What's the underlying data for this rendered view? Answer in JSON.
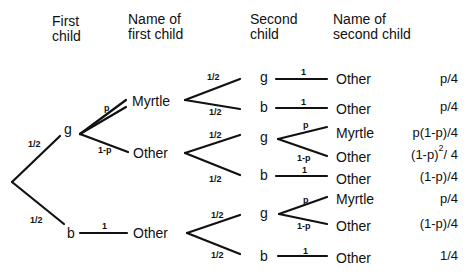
{
  "headers": {
    "first_child": "First\nchild",
    "first_child_l1": "First",
    "first_child_l2": "child",
    "name_first_l1": "Name of",
    "name_first_l2": "first  child",
    "second_child_l1": "Second",
    "second_child_l2": "child",
    "name_second_l1": "Name of",
    "name_second_l2": "second child"
  },
  "level1": {
    "g": {
      "node": "g",
      "edge_label": "1/2"
    },
    "b": {
      "node": "b",
      "edge_label": "1/2"
    }
  },
  "level2": {
    "myrtle": {
      "name": "Myrtle",
      "edge_label": "p"
    },
    "other_g": {
      "name": "Other",
      "edge_label": "1-p"
    },
    "other_b": {
      "name": "Other",
      "edge_label": "1"
    }
  },
  "level3": [
    {
      "node": "g",
      "edge_label": "1/2"
    },
    {
      "node": "b",
      "edge_label": "1/2"
    },
    {
      "node": "g",
      "edge_label": "1/2"
    },
    {
      "node": "b",
      "edge_label": "1/2"
    },
    {
      "node": "g",
      "edge_label": "1/2"
    },
    {
      "node": "b",
      "edge_label": "1/2"
    }
  ],
  "leaves": [
    {
      "name": "Other",
      "edge_label": "1",
      "prob": "p/4"
    },
    {
      "name": "Other",
      "edge_label": "1",
      "prob": "p/4"
    },
    {
      "name": "Myrtle",
      "edge_label": "p",
      "prob": "p(1-p)/4"
    },
    {
      "name": "Other",
      "edge_label": "1-p",
      "prob_base": "(1-p)",
      "prob_exp": "2",
      "prob_tail": "/ 4"
    },
    {
      "name": "Other",
      "edge_label": "1",
      "prob": "(1-p)/4"
    },
    {
      "name": "Myrtle",
      "edge_label": "p",
      "prob": "p/4"
    },
    {
      "name": "Other",
      "edge_label": "1-p",
      "prob": "(1-p)/4"
    },
    {
      "name": "Other",
      "edge_label": "1",
      "prob": "1/4"
    }
  ]
}
